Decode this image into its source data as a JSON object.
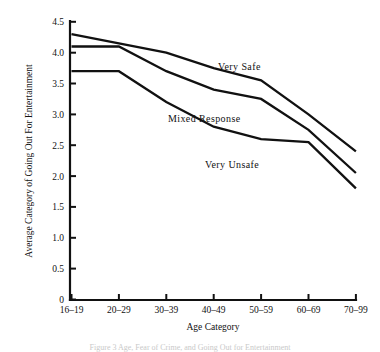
{
  "figure": {
    "caption_fragment": "Figure 3  Age, Fear of Crime, and Going Out for Entertainment"
  },
  "chart_data": {
    "type": "line",
    "title": "",
    "xlabel": "Age Category",
    "ylabel": "Average Category of Going Out For Entertainment",
    "categories": [
      "16–19",
      "20–29",
      "30–39",
      "40–49",
      "50–59",
      "60–69",
      "70–99"
    ],
    "ylim": [
      0,
      4.5
    ],
    "yticks": [
      "0",
      "0.5",
      "1.0",
      "1.5",
      "2.0",
      "2.5",
      "3.0",
      "3.5",
      "4.0",
      "4.5"
    ],
    "ytick_values": [
      0,
      0.5,
      1.0,
      1.5,
      2.0,
      2.5,
      3.0,
      3.5,
      4.0,
      4.5
    ],
    "grid": false,
    "legend_position": "inline-annotations",
    "series": [
      {
        "name": "Very Safe",
        "values": [
          4.3,
          4.15,
          4.0,
          3.75,
          3.55,
          3.0,
          2.4
        ],
        "color": "#111111",
        "label_x_category": "40–49",
        "label_value": 3.95
      },
      {
        "name": "Mixed Response",
        "values": [
          4.1,
          4.1,
          3.7,
          3.4,
          3.25,
          2.75,
          2.05
        ],
        "color": "#111111",
        "label_x_category": "30–39",
        "label_value": 3.0
      },
      {
        "name": "Very Unsafe",
        "values": [
          3.7,
          3.7,
          3.2,
          2.8,
          2.6,
          2.55,
          1.8
        ],
        "color": "#111111",
        "label_x_category": "40–49",
        "label_value": 2.25
      }
    ],
    "annotations": [
      {
        "text": "Very Safe",
        "x": 218,
        "y": 70
      },
      {
        "text": "Mixed Response",
        "x": 168,
        "y": 122
      },
      {
        "text": "Very Unsafe",
        "x": 205,
        "y": 168
      }
    ]
  }
}
